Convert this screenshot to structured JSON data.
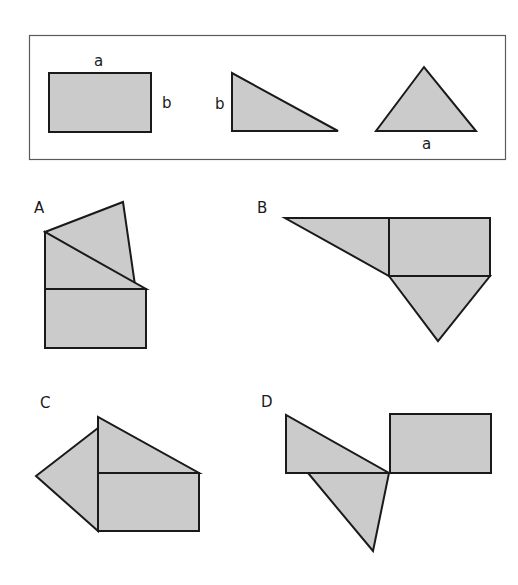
{
  "legend": {
    "rectangle": {
      "top_label": "a",
      "side_label": "b"
    },
    "right_triangle": {
      "side_label": "b"
    },
    "isosceles_triangle": {
      "base_label": "a"
    }
  },
  "options": [
    {
      "label": "A"
    },
    {
      "label": "B"
    },
    {
      "label": "C"
    },
    {
      "label": "D"
    }
  ],
  "colors": {
    "fill": "#cbcbcb",
    "stroke": "#1a1a1a",
    "frame": "#5a5a5a"
  }
}
